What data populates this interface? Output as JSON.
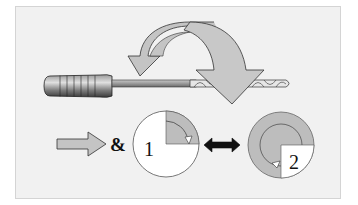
{
  "diagram": {
    "type": "illustration",
    "labels": {
      "ampersand": "&",
      "step1": "1",
      "step2": "2"
    },
    "colors": {
      "background": "#f1f1f1",
      "arrow_fill": "#c4c4c4",
      "arrow_stroke": "#333333",
      "circle_gray": "#b8b8b8",
      "circle_white": "#ffffff",
      "double_arrow": "#111111"
    },
    "elements": [
      {
        "id": "tool",
        "description": "handle with grooves, shaft, twisted drill bit"
      },
      {
        "id": "curved-arrow",
        "description": "large curved rotation arrow over the tool"
      },
      {
        "id": "push-arrow",
        "description": "forward-pointing block arrow"
      },
      {
        "id": "circle-1",
        "description": "white circle with gray quarter sector and arrow"
      },
      {
        "id": "double-arrow",
        "description": "black bidirectional arrow"
      },
      {
        "id": "circle-2",
        "description": "gray circle with white quarter and curved arrow"
      }
    ]
  }
}
